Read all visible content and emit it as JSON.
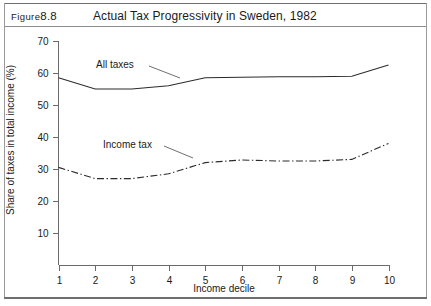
{
  "figure": {
    "label_prefix": "Figure",
    "label_number": "8.8",
    "title": "Actual Tax Progressivity in Sweden, 1982"
  },
  "chart_data": {
    "type": "line",
    "title": "Actual Tax Progressivity in Sweden, 1982",
    "xlabel": "Income decile",
    "ylabel": "Share of taxes in total income (%)",
    "x": [
      1,
      2,
      3,
      4,
      5,
      6,
      7,
      8,
      9,
      10
    ],
    "categories": [
      "1",
      "2",
      "3",
      "4",
      "5",
      "6",
      "7",
      "8",
      "9",
      "10"
    ],
    "xlim": [
      1,
      10
    ],
    "ylim": [
      0,
      70
    ],
    "yticks": [
      10,
      20,
      30,
      40,
      50,
      60,
      70
    ],
    "ytick_labels": [
      "10",
      "20",
      "30",
      "40",
      "50",
      "60",
      "70"
    ],
    "xticks": [
      1,
      2,
      3,
      4,
      5,
      6,
      7,
      8,
      9,
      10
    ],
    "xtick_labels": [
      "1",
      "2",
      "3",
      "4",
      "5",
      "6",
      "7",
      "8",
      "9",
      "10"
    ],
    "grid": false,
    "legend_position": "inline-annotations",
    "series": [
      {
        "name": "All taxes",
        "style": "solid",
        "values": [
          58.5,
          55.0,
          55.0,
          56.0,
          58.5,
          58.7,
          58.8,
          58.8,
          59.0,
          62.5
        ]
      },
      {
        "name": "Income tax",
        "style": "dash-dot",
        "values": [
          30.5,
          27.0,
          27.0,
          28.5,
          32.0,
          32.8,
          32.5,
          32.5,
          33.0,
          38.0
        ]
      }
    ],
    "annotations": [
      {
        "text": "All taxes",
        "x": 2.6,
        "y": 65.5
      },
      {
        "text": "Income tax",
        "x": 3.0,
        "y": 41.5
      }
    ]
  }
}
